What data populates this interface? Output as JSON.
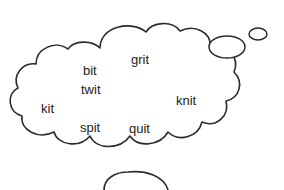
{
  "canvas": {
    "width": 284,
    "height": 190,
    "background_color": "#ffffff"
  },
  "illustration": {
    "name": "thought-bubble-word-cloud",
    "outline_color": "#2b2b2b",
    "fill_color": "#ffffff",
    "text_color": "#1d1d1d"
  },
  "words": [
    {
      "text": "grit",
      "x": 131,
      "y": 53,
      "size": 13
    },
    {
      "text": "bit",
      "x": 83,
      "y": 64,
      "size": 13
    },
    {
      "text": "twit",
      "x": 81,
      "y": 83,
      "size": 13
    },
    {
      "text": "kit",
      "x": 41,
      "y": 102,
      "size": 13
    },
    {
      "text": "knit",
      "x": 176,
      "y": 94,
      "size": 13
    },
    {
      "text": "spit",
      "x": 80,
      "y": 121,
      "size": 13
    },
    {
      "text": "quit",
      "x": 129,
      "y": 122,
      "size": 13
    }
  ],
  "trail_bubbles": [
    {
      "name": "trail-bubble-large",
      "cx": 227,
      "cy": 47,
      "rx": 18,
      "ry": 11
    },
    {
      "name": "trail-bubble-small",
      "cx": 258,
      "cy": 34,
      "rx": 9,
      "ry": 6
    }
  ]
}
